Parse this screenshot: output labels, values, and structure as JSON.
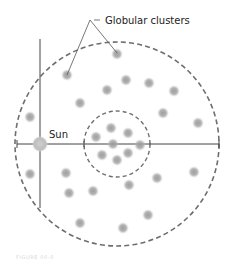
{
  "diagram": {
    "title_label": "Globular clusters",
    "sun_label": "Sun",
    "caption": "FIGURE 00-0",
    "colors": {
      "cluster": "#8c8c8c",
      "sun": "#b4b4b4",
      "dashed_circle": "#6e6e6e",
      "axis_line": "#444444",
      "background": "#ffffff"
    },
    "elements": {
      "outer_halo": "outer dashed circle (galactic halo)",
      "inner_core": "inner dashed circle (central concentration)",
      "galactic_plane": "horizontal line",
      "sun_offset_line": "vertical line through Sun",
      "cluster_count": 28,
      "inner_cluster_count": 8,
      "annotated_clusters": 2
    }
  }
}
